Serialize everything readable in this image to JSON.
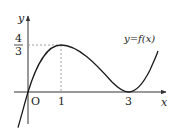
{
  "diagram": {
    "type": "function-graph",
    "function_label": "y=f(x)",
    "axes": {
      "x_label": "x",
      "y_label": "y",
      "origin_label": "O"
    },
    "x_ticks": [
      "1",
      "3"
    ],
    "y_ticks": [
      {
        "numerator": "4",
        "denominator": "3"
      }
    ],
    "key_points": [
      {
        "x": 0,
        "y": 0,
        "note": "passes through origin"
      },
      {
        "x": 1,
        "y": 1.3333,
        "note": "local maximum (1, 4/3)"
      },
      {
        "x": 3,
        "y": 0,
        "note": "local minimum, tangent to x-axis"
      }
    ],
    "colors": {
      "curve": "#1a1a1a",
      "axes": "#333333",
      "dashed": "#888888"
    }
  }
}
